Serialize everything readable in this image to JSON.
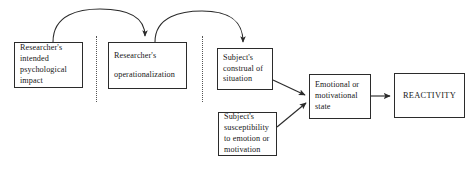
{
  "diagram": {
    "background_color": "#ffffff",
    "stroke_color": "#2b2b2b",
    "divider_color": "#555555",
    "nodes": [
      {
        "id": "intended-impact",
        "label": "Researcher's\nintended\npsychological\nimpact"
      },
      {
        "id": "operationalization",
        "label": "Researcher's\noperationalization"
      },
      {
        "id": "construal",
        "label": "Subject's\nconstrual of\nsituation"
      },
      {
        "id": "susceptibility",
        "label": "Subject's\nsusceptibility\nto emotion or\nmotivation"
      },
      {
        "id": "emotional-state",
        "label": "Emotional or\nmotivational\nstate"
      },
      {
        "id": "reactivity",
        "label": "REACTIVITY"
      }
    ],
    "connectors": [
      {
        "id": "arc-impact-to-operationalization",
        "kind": "curved-arrow",
        "from": "intended-impact",
        "to": "operationalization"
      },
      {
        "id": "arc-operationalization-to-construal",
        "kind": "curved-arrow",
        "from": "operationalization",
        "to": "construal"
      },
      {
        "id": "arrow-construal-to-state",
        "kind": "straight-arrow",
        "from": "construal",
        "to": "emotional-state"
      },
      {
        "id": "arrow-susceptibility-to-state",
        "kind": "straight-arrow",
        "from": "susceptibility",
        "to": "emotional-state"
      },
      {
        "id": "arrow-state-to-reactivity",
        "kind": "straight-arrow",
        "from": "emotional-state",
        "to": "reactivity"
      }
    ],
    "dividers": [
      {
        "id": "divider-one",
        "style": "dotted-vertical"
      },
      {
        "id": "divider-two",
        "style": "dotted-vertical"
      }
    ]
  }
}
